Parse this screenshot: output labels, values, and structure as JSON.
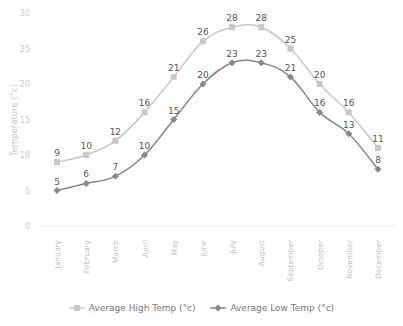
{
  "chart_data": {
    "type": "line",
    "title": "",
    "xlabel": "",
    "ylabel": "Temperature (°c)",
    "ylim": [
      0,
      30
    ],
    "yticks": [
      0,
      5,
      10,
      15,
      20,
      25,
      30
    ],
    "grid": false,
    "legend_position": "bottom",
    "categories": [
      "January",
      "February",
      "March",
      "April",
      "May",
      "June",
      "July",
      "August",
      "September",
      "October",
      "November",
      "December"
    ],
    "series": [
      {
        "name": "Average High Temp (°c)",
        "color": "#c8c8c8",
        "marker": "square",
        "values": [
          9,
          10,
          12,
          16,
          21,
          26,
          28,
          28,
          25,
          20,
          16,
          11
        ]
      },
      {
        "name": "Average Low Temp (°c)",
        "color": "#888888",
        "marker": "diamond",
        "values": [
          5,
          6,
          7,
          10,
          15,
          20,
          23,
          23,
          21,
          16,
          13,
          8
        ]
      }
    ]
  },
  "legend": {
    "high_label": "Average High Temp (°c)",
    "low_label": "Average Low Temp (°c)"
  }
}
